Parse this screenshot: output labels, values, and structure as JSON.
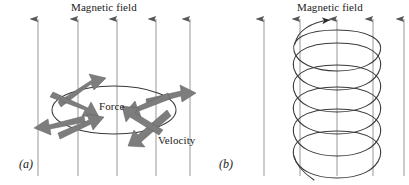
{
  "figure": {
    "width": 409,
    "height": 185,
    "background": "#ffffff",
    "ink_color": "#404040",
    "arrow_color": "#808080",
    "text_color": "#1a1a1a"
  },
  "panels": [
    {
      "id": "a",
      "caption": "(a)",
      "title": "Magnetic field",
      "description": "Charged particle in circular orbit perpendicular to a uniform magnetic field",
      "field_lines": {
        "count": 5,
        "direction": "up",
        "x_positions": [
          38,
          78,
          117,
          156,
          190
        ],
        "y_top": 18,
        "y_bottom": 176
      },
      "orbit": {
        "shape": "ellipse",
        "center_x": 114,
        "center_y": 110,
        "radius_x": 62,
        "radius_y": 24
      },
      "labels": [
        {
          "name": "force",
          "text": "Force"
        },
        {
          "name": "velocity",
          "text": "Velocity"
        }
      ],
      "vectors": [
        {
          "type": "velocity",
          "position": "upper-left",
          "points": "outward-up-left"
        },
        {
          "type": "force",
          "position": "upper-left",
          "points": "inward-right-down"
        },
        {
          "type": "velocity",
          "position": "upper-right",
          "points": "outward-right"
        },
        {
          "type": "force",
          "position": "upper-right",
          "points": "inward-left"
        },
        {
          "type": "velocity",
          "position": "lower-left",
          "points": "outward-left"
        },
        {
          "type": "force",
          "position": "lower-left",
          "points": "inward-right-up"
        },
        {
          "type": "velocity",
          "position": "lower-right",
          "points": "outward-down"
        },
        {
          "type": "force",
          "position": "lower-right",
          "points": "inward-left-up"
        }
      ]
    },
    {
      "id": "b",
      "caption": "(b)",
      "title": "Magnetic field",
      "description": "Charged particle following a helical path along the magnetic field",
      "field_lines": {
        "count": 5,
        "direction": "up",
        "x_positions": [
          264,
          300,
          337,
          373,
          404
        ],
        "y_top": 18,
        "y_bottom": 176
      },
      "helix": {
        "turns": 6.5,
        "center_x": 337,
        "radius_x": 45,
        "radius_y": 15,
        "y_top": 30,
        "y_bottom": 172,
        "arrow_at": "top"
      }
    }
  ]
}
